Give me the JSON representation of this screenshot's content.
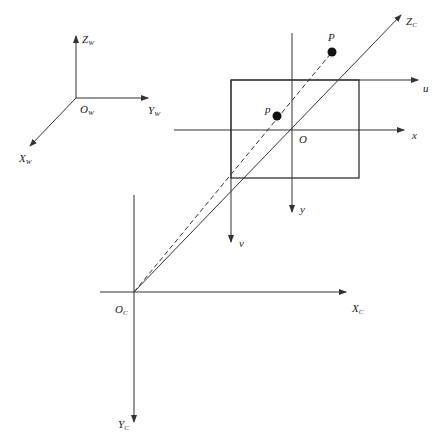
{
  "diagram": {
    "type": "camera-coordinate-systems",
    "colors": {
      "line": "#333333",
      "background": "#ffffff",
      "point": "#111111"
    },
    "world_frame": {
      "origin": {
        "main": "O",
        "sub": "W"
      },
      "axes": [
        {
          "main": "Z",
          "sub": "W"
        },
        {
          "main": "Y",
          "sub": "W"
        },
        {
          "main": "X",
          "sub": "W"
        }
      ]
    },
    "camera_frame": {
      "origin": {
        "main": "O",
        "sub": "C"
      },
      "axes": [
        {
          "main": "X",
          "sub": "C"
        },
        {
          "main": "Y",
          "sub": "C"
        },
        {
          "main": "Z",
          "sub": "C"
        }
      ]
    },
    "image_plane": {
      "pixel_axes": [
        "u",
        "v"
      ],
      "image_axes": [
        "x",
        "y"
      ],
      "principal_point": "O"
    },
    "points": {
      "world_point": "P",
      "image_point": "p"
    }
  }
}
